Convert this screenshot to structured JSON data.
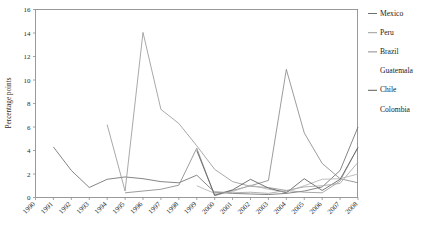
{
  "chart_data": {
    "type": "line",
    "title": "",
    "xlabel": "",
    "ylabel": "Percentage points",
    "ylim": [
      0,
      16
    ],
    "yticks": [
      0,
      2,
      4,
      6,
      8,
      10,
      12,
      14,
      16
    ],
    "grid": false,
    "legend_position": "right",
    "x": [
      1990,
      1991,
      1992,
      1993,
      1994,
      1995,
      1996,
      1997,
      1998,
      1999,
      2000,
      2001,
      2002,
      2003,
      2004,
      2005,
      2006,
      2007,
      2008
    ],
    "xticklabels": [
      "1990",
      "1991",
      "1992",
      "1993",
      "1994",
      "1995",
      "1996",
      "1997",
      "1998",
      "1999",
      "2000",
      "2001",
      "2002",
      "2003",
      "2004",
      "2005",
      "2006",
      "2007",
      "2008"
    ],
    "series": [
      {
        "name": "Mexico",
        "color": "#6f6f6f",
        "values": [
          null,
          4.3,
          2.3,
          0.85,
          1.55,
          1.75,
          1.6,
          1.35,
          1.25,
          1.9,
          0.45,
          0.35,
          0.3,
          0.25,
          0.35,
          0.55,
          0.9,
          2.3,
          6.0
        ]
      },
      {
        "name": "Peru",
        "color": "#9a9a9a",
        "values": [
          null,
          null,
          null,
          null,
          6.2,
          0.55,
          14.05,
          7.5,
          6.3,
          4.4,
          2.4,
          1.35,
          0.95,
          0.85,
          0.6,
          0.45,
          0.4,
          1.4,
          4.3
        ]
      },
      {
        "name": "Brazil",
        "color": "#8a8a8a",
        "values": [
          null,
          null,
          null,
          null,
          null,
          0.4,
          0.55,
          0.7,
          1.05,
          4.2,
          0.15,
          0.6,
          1.0,
          1.45,
          10.9,
          5.5,
          2.9,
          1.6,
          1.25
        ]
      },
      {
        "name": "Guatemala",
        "color": "#b4b4b4",
        "values": [
          null,
          null,
          null,
          null,
          null,
          null,
          null,
          null,
          null,
          1.0,
          0.35,
          0.5,
          1.05,
          0.7,
          0.5,
          1.0,
          1.55,
          1.6,
          2.0
        ]
      },
      {
        "name": "Chile",
        "color": "#5d5d5d",
        "values": [
          null,
          null,
          null,
          null,
          null,
          null,
          null,
          null,
          null,
          4.0,
          0.2,
          0.65,
          1.55,
          0.8,
          0.4,
          1.6,
          0.6,
          1.55,
          4.25
        ]
      },
      {
        "name": "Colombia",
        "color": "#a5a5a5",
        "values": [
          null,
          null,
          null,
          null,
          null,
          null,
          null,
          null,
          null,
          null,
          0.5,
          0.4,
          0.45,
          0.35,
          0.6,
          0.9,
          1.0,
          1.2,
          3.0
        ]
      }
    ]
  },
  "legend": {
    "items": [
      {
        "label": "Mexico",
        "color": "#6f6f6f",
        "has_line": true
      },
      {
        "label": "Peru",
        "color": "#9a9a9a",
        "has_line": true
      },
      {
        "label": "Brazil",
        "color": "#8a8a8a",
        "has_line": true
      },
      {
        "label": "Guatemala",
        "color": "#b4b4b4",
        "has_line": false
      },
      {
        "label": "Chile",
        "color": "#5d5d5d",
        "has_line": true
      },
      {
        "label": "Colombia",
        "color": "#a5a5a5",
        "has_line": false
      }
    ]
  }
}
